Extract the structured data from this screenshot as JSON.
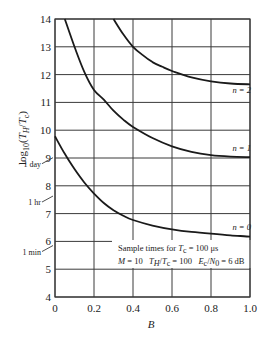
{
  "chart_data": {
    "type": "line",
    "title": "",
    "xlabel": "B",
    "ylabel": "log10(TH/Tc)",
    "ylabel_parts": {
      "prefix": "log",
      "sub1": "10",
      "open": "(",
      "T1": "T",
      "sub2": "H",
      "slash": "/",
      "T2": "T",
      "sub3": "c",
      "close": ")"
    },
    "xlim": [
      0,
      1.0
    ],
    "ylim": [
      4,
      14
    ],
    "grid": true,
    "x_ticks": [
      "0",
      "0.2",
      "0.4",
      "0.6",
      "0.8",
      "1.0"
    ],
    "y_ticks": [
      "4",
      "5",
      "6",
      "7",
      "8",
      "9",
      "10",
      "11",
      "12",
      "13",
      "14"
    ],
    "series": [
      {
        "name": "n = 0",
        "x": [
          0.0,
          0.05,
          0.1,
          0.15,
          0.2,
          0.25,
          0.3,
          0.35,
          0.4,
          0.5,
          0.6,
          0.7,
          0.8,
          0.9,
          1.0
        ],
        "y": [
          9.78,
          9.15,
          8.6,
          8.12,
          7.72,
          7.38,
          7.12,
          6.92,
          6.77,
          6.57,
          6.43,
          6.34,
          6.28,
          6.22,
          6.17
        ]
      },
      {
        "name": "n = 1",
        "x": [
          0.05,
          0.1,
          0.15,
          0.2,
          0.25,
          0.3,
          0.35,
          0.4,
          0.5,
          0.6,
          0.7,
          0.8,
          0.9,
          1.0
        ],
        "y": [
          14.0,
          13.0,
          12.1,
          11.45,
          11.1,
          10.7,
          10.38,
          10.12,
          9.72,
          9.42,
          9.22,
          9.1,
          9.05,
          9.03
        ]
      },
      {
        "name": "n = 2",
        "x": [
          0.3,
          0.35,
          0.4,
          0.45,
          0.5,
          0.55,
          0.6,
          0.7,
          0.8,
          0.9,
          1.0
        ],
        "y": [
          14.0,
          13.45,
          13.0,
          12.7,
          12.45,
          12.28,
          12.13,
          11.9,
          11.76,
          11.68,
          11.65
        ]
      }
    ],
    "curve_labels": [
      {
        "text": "n = 2",
        "x": 0.91,
        "y": 11.35
      },
      {
        "text": "n = 1",
        "x": 0.91,
        "y": 9.25
      },
      {
        "text": "n = 0",
        "x": 0.91,
        "y": 6.4
      }
    ],
    "time_markers": [
      {
        "label": "1 day",
        "value": 8.94
      },
      {
        "label": "1 hr",
        "value": 7.56
      },
      {
        "label": "1 min",
        "value": 5.78
      }
    ],
    "annotations": {
      "line1": {
        "a": "Sample times for ",
        "T": "T",
        "sub": "c",
        "b": " = 100 μs"
      },
      "line2": {
        "M": "M",
        "mval": " = 10   ",
        "T1": "T",
        "s1": "H",
        "slash": "/",
        "T2": "T",
        "s2": "c",
        "rval": " = 100   ",
        "E": "E",
        "s3": "c",
        "slash2": "/",
        "N": "N",
        "s4": "0",
        "eval": " = 6 dB"
      }
    },
    "colors": {
      "curve": "#1a1a1a",
      "grid": "#3a3a3a",
      "text": "#222222",
      "background": "#ffffff"
    }
  }
}
